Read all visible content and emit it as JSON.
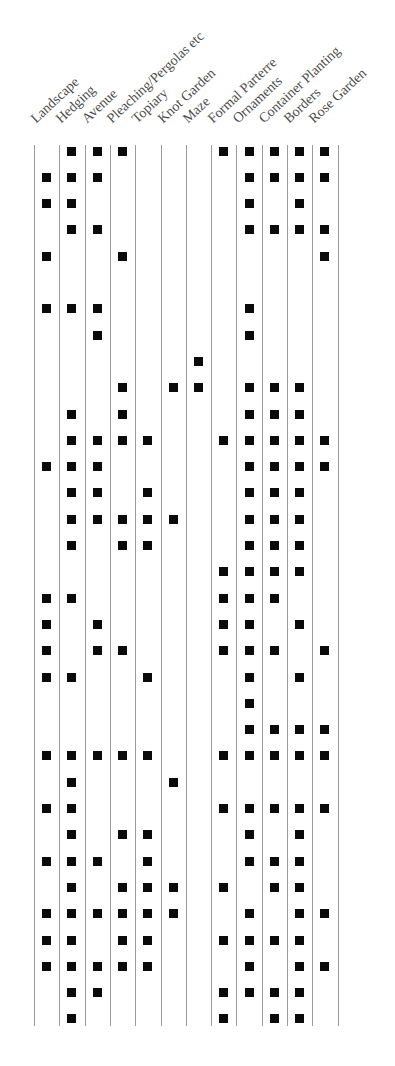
{
  "chart_data": {
    "type": "table",
    "title": "",
    "columns": [
      "Landscape",
      "Hedging",
      "Avenue",
      "Pleaching/Pergolas etc",
      "Topiary",
      "Knot Garden",
      "Maze",
      "Formal Parterre",
      "Ornaments",
      "Container Planting",
      "Borders",
      "Rose Garden"
    ],
    "rows": [
      [
        0,
        1,
        1,
        1,
        0,
        0,
        0,
        1,
        1,
        1,
        1,
        1
      ],
      [
        1,
        1,
        1,
        0,
        0,
        0,
        0,
        0,
        1,
        1,
        1,
        1
      ],
      [
        1,
        1,
        0,
        0,
        0,
        0,
        0,
        0,
        1,
        0,
        1,
        0
      ],
      [
        0,
        1,
        1,
        0,
        0,
        0,
        0,
        0,
        1,
        1,
        1,
        1
      ],
      [
        1,
        0,
        0,
        1,
        0,
        0,
        0,
        0,
        0,
        0,
        0,
        1
      ],
      [
        0,
        0,
        0,
        0,
        0,
        0,
        0,
        0,
        0,
        0,
        0,
        0
      ],
      [
        1,
        1,
        1,
        0,
        0,
        0,
        0,
        0,
        1,
        0,
        0,
        0
      ],
      [
        0,
        0,
        1,
        0,
        0,
        0,
        0,
        0,
        1,
        0,
        0,
        0
      ],
      [
        0,
        0,
        0,
        0,
        0,
        0,
        1,
        0,
        0,
        0,
        0,
        0
      ],
      [
        0,
        0,
        0,
        1,
        0,
        1,
        1,
        0,
        1,
        1,
        1,
        0
      ],
      [
        0,
        1,
        0,
        1,
        0,
        0,
        0,
        0,
        1,
        1,
        1,
        0
      ],
      [
        0,
        1,
        1,
        1,
        1,
        0,
        0,
        1,
        1,
        1,
        1,
        1
      ],
      [
        1,
        1,
        1,
        0,
        0,
        0,
        0,
        0,
        1,
        1,
        1,
        1
      ],
      [
        0,
        1,
        1,
        0,
        1,
        0,
        0,
        0,
        1,
        1,
        1,
        0
      ],
      [
        0,
        1,
        1,
        1,
        1,
        1,
        0,
        0,
        1,
        1,
        1,
        0
      ],
      [
        0,
        1,
        0,
        1,
        1,
        0,
        0,
        0,
        1,
        1,
        1,
        0
      ],
      [
        0,
        0,
        0,
        0,
        0,
        0,
        0,
        1,
        1,
        1,
        1,
        0
      ],
      [
        1,
        1,
        0,
        0,
        0,
        0,
        0,
        1,
        1,
        1,
        0,
        0
      ],
      [
        1,
        0,
        1,
        0,
        0,
        0,
        0,
        1,
        1,
        0,
        1,
        0
      ],
      [
        1,
        0,
        1,
        1,
        0,
        0,
        0,
        1,
        1,
        1,
        0,
        1
      ],
      [
        1,
        1,
        0,
        0,
        1,
        0,
        0,
        0,
        1,
        0,
        1,
        0
      ],
      [
        0,
        0,
        0,
        0,
        0,
        0,
        0,
        0,
        1,
        0,
        0,
        0
      ],
      [
        0,
        0,
        0,
        0,
        0,
        0,
        0,
        0,
        1,
        1,
        1,
        1
      ],
      [
        1,
        1,
        1,
        1,
        1,
        0,
        0,
        1,
        1,
        1,
        1,
        1
      ],
      [
        0,
        1,
        0,
        0,
        0,
        1,
        0,
        0,
        0,
        0,
        0,
        0
      ],
      [
        1,
        1,
        0,
        0,
        0,
        0,
        0,
        1,
        1,
        1,
        1,
        1
      ],
      [
        0,
        1,
        0,
        1,
        1,
        0,
        0,
        0,
        1,
        0,
        1,
        0
      ],
      [
        1,
        1,
        1,
        0,
        1,
        0,
        0,
        0,
        1,
        1,
        1,
        0
      ],
      [
        0,
        1,
        0,
        1,
        1,
        1,
        0,
        1,
        0,
        1,
        1,
        0
      ],
      [
        1,
        1,
        1,
        1,
        1,
        1,
        0,
        0,
        1,
        0,
        1,
        1
      ],
      [
        1,
        1,
        0,
        1,
        1,
        0,
        0,
        1,
        1,
        1,
        1,
        0
      ],
      [
        1,
        1,
        1,
        1,
        1,
        0,
        0,
        0,
        1,
        0,
        1,
        1
      ],
      [
        0,
        1,
        1,
        0,
        0,
        0,
        0,
        1,
        1,
        1,
        1,
        0
      ],
      [
        0,
        1,
        0,
        0,
        0,
        0,
        0,
        1,
        0,
        1,
        1,
        0
      ]
    ],
    "marker": "filled-square",
    "header_orientation": "rotated ~43deg",
    "grid": "vertical column dividers only",
    "colors": {
      "marker": "#0a0a0a",
      "line": "#9a9a9a",
      "label": "#4a4a4a"
    }
  },
  "layout": {
    "grid_left": 34,
    "col_width": 25.3,
    "grid_top": 145,
    "grid_bottom": 1026,
    "first_row_center": 151,
    "row_height": 26.3,
    "label_baseline_y": 126
  }
}
